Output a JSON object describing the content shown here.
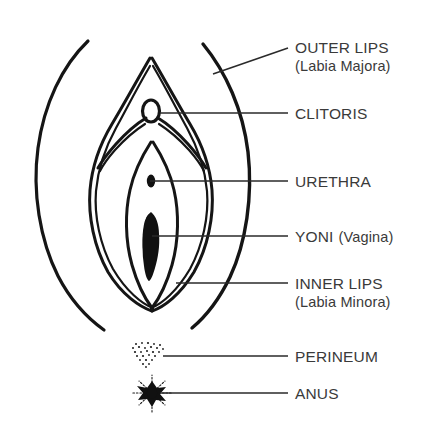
{
  "diagram": {
    "style": "black line drawing on white background",
    "background_color": "#ffffff",
    "ink_color": "#151515",
    "text_color": "#3a3a3a",
    "leader_color": "#2a2a2a"
  },
  "labels": [
    {
      "id": "outer-lips",
      "primary": "OUTER LIPS",
      "secondary": "(Labia Majora)",
      "x": 295,
      "y": 38,
      "leader": "diagonal",
      "leader_from": [
        288,
        48
      ],
      "leader_to": [
        213,
        74
      ]
    },
    {
      "id": "clitoris",
      "primary": "CLITORIS",
      "secondary": "",
      "x": 295,
      "y": 104,
      "leader": "horizontal",
      "leader_from": [
        288,
        113
      ],
      "leader_to": [
        160,
        113
      ]
    },
    {
      "id": "urethra",
      "primary": "URETHRA",
      "secondary": "",
      "x": 295,
      "y": 172,
      "leader": "horizontal",
      "leader_from": [
        288,
        181
      ],
      "leader_to": [
        150,
        181
      ]
    },
    {
      "id": "yoni-vagina",
      "primary": "YONI",
      "secondary": "(Vagina)",
      "x": 295,
      "y": 227,
      "leader": "horizontal",
      "leader_from": [
        288,
        236
      ],
      "leader_to": [
        152,
        236
      ]
    },
    {
      "id": "inner-lips",
      "primary": "INNER LIPS",
      "secondary": "(Labia Minora)",
      "x": 295,
      "y": 274,
      "leader": "horizontal",
      "leader_from": [
        288,
        283
      ],
      "leader_to": [
        176,
        283
      ]
    },
    {
      "id": "perineum",
      "primary": "PERINEUM",
      "secondary": "",
      "x": 295,
      "y": 347,
      "leader": "horizontal",
      "leader_from": [
        288,
        356
      ],
      "leader_to": [
        163,
        356
      ]
    },
    {
      "id": "anus",
      "primary": "ANUS",
      "secondary": "",
      "x": 295,
      "y": 384,
      "leader": "horizontal",
      "leader_from": [
        288,
        393
      ],
      "leader_to": [
        160,
        393
      ]
    }
  ],
  "features": {
    "outer_lip_left": "open crescent arc on left side",
    "outer_lip_right": "open crescent arc on right side",
    "inner_lips": "double-outlined teardrop forms converging at top and bottom",
    "clitoris_shape": "small hollow vertical oval at apex",
    "urethra_shape": "small solid dot",
    "vaginal_opening_shape": "elongated solid vertical shape",
    "perineum_shape": "stippled dotted triangular patch",
    "anus_shape": "dark starburst blob with radiating dotted spokes"
  }
}
